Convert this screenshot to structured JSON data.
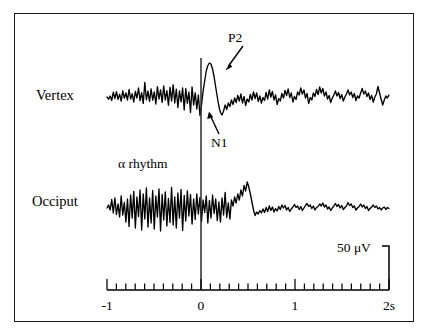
{
  "figure": {
    "type": "eeg-erp-waveform-figure",
    "background_color": "#ffffff",
    "border_color": "#1a1a1a",
    "trace_color": "#000000"
  },
  "labels": {
    "vertex": "Vertex",
    "occiput": "Occiput",
    "alpha_rhythm": "α rhythm",
    "p2": "P2",
    "n1": "N1",
    "scale_bar": "50 μV"
  },
  "axis": {
    "xlabel": "",
    "unit_suffix": "s",
    "tick_labels": [
      "-1",
      "0",
      "1",
      "2s"
    ],
    "tick_label_values": [
      -1,
      0,
      1,
      2
    ],
    "minor_tick_interval": 0.1,
    "xmin": -1,
    "xmax": 2,
    "stimulus_time": 0
  },
  "chart_data": {
    "type": "line",
    "title": "",
    "subtitle": "",
    "xlabel": "Time (s)",
    "ylabel": "Amplitude (μV)",
    "xlim": [
      -1,
      2
    ],
    "grid": false,
    "legend": "none",
    "annotations": [
      {
        "label": "P2",
        "channel": "Vertex",
        "time": 0.2,
        "kind": "positive-peak",
        "arrow": "down-left"
      },
      {
        "label": "N1",
        "channel": "Vertex",
        "time": 0.09,
        "kind": "negative-peak",
        "arrow": "up-left"
      },
      {
        "label": "α rhythm",
        "channel": "Occiput",
        "time": -0.55,
        "kind": "region-note",
        "arrow": "none"
      },
      {
        "label": "50 μV",
        "kind": "scale-bar",
        "value": 50,
        "unit": "μV"
      }
    ],
    "scale_bar": {
      "value": 50,
      "unit": "μV",
      "time_position": 2.0
    },
    "stimulus_marker": {
      "time": 0,
      "style": "vertical-line"
    },
    "series": [
      {
        "name": "Vertex",
        "baseline_y": 97,
        "amplitude_scale": 1.0,
        "values": [
          0.0,
          -2.2,
          1.0,
          -3.4,
          4.8,
          -1.6,
          5.4,
          -2.4,
          2.8,
          -4.2,
          6.2,
          -1.2,
          4.0,
          -3.0,
          7.5,
          -2.0,
          3.2,
          -5.0,
          5.6,
          -1.0,
          9.0,
          -3.6,
          4.4,
          -6.4,
          14.5,
          -2.8,
          6.0,
          -4.4,
          8.2,
          -3.2,
          5.0,
          -7.0,
          10.4,
          -2.0,
          7.2,
          -5.4,
          11.0,
          -3.0,
          6.4,
          -8.2,
          9.6,
          -4.0,
          12.2,
          -6.0,
          7.8,
          -10.5,
          6.2,
          -4.8,
          9.0,
          -13.0,
          8.4,
          -6.2,
          5.0,
          -15.5,
          10.0,
          -8.0,
          4.2,
          -12.0,
          2.0,
          -18.5,
          -8.0,
          6.0,
          16.0,
          26.0,
          31.5,
          34.0,
          33.0,
          28.0,
          20.0,
          10.0,
          0.0,
          -9.0,
          -15.5,
          -18.0,
          -14.0,
          -8.0,
          -12.5,
          -6.0,
          -9.5,
          -3.0,
          -7.5,
          -1.0,
          -5.5,
          1.5,
          -4.0,
          3.0,
          -6.0,
          0.5,
          -8.5,
          -2.0,
          -5.0,
          2.5,
          -3.0,
          5.0,
          -1.5,
          4.0,
          -4.5,
          1.0,
          -6.0,
          -0.5,
          -3.5,
          4.5,
          -2.0,
          7.0,
          0.0,
          5.5,
          -3.0,
          2.0,
          -7.5,
          -1.5,
          -4.0,
          3.5,
          -1.0,
          6.5,
          1.5,
          8.0,
          -0.5,
          4.0,
          -5.0,
          0.5,
          -2.5,
          5.0,
          2.0,
          9.0,
          3.0,
          7.0,
          -1.0,
          3.5,
          -6.5,
          -0.5,
          -3.0,
          4.0,
          0.5,
          7.5,
          2.5,
          10.0,
          4.0,
          8.5,
          1.0,
          5.0,
          -2.0,
          1.5,
          -5.5,
          -1.0,
          2.0,
          6.0,
          1.0,
          4.5,
          -1.5,
          2.5,
          -4.0,
          0.0,
          3.0,
          7.0,
          2.0,
          5.0,
          -0.5,
          3.5,
          -3.5,
          1.0,
          -1.0,
          4.0,
          8.5,
          3.0,
          6.0,
          0.5,
          4.0,
          -2.5,
          1.5,
          -5.0,
          0.0,
          3.0,
          10.5,
          4.0,
          -2.0,
          -8.0,
          -3.0,
          1.0,
          -1.0,
          2.0
        ]
      },
      {
        "name": "Occiput",
        "baseline_y": 208,
        "amplitude_scale": 1.0,
        "values": [
          0.0,
          3.0,
          -2.0,
          8.5,
          -5.0,
          10.0,
          -6.5,
          4.0,
          -9.0,
          12.0,
          -7.0,
          5.5,
          -14.0,
          9.0,
          -18.5,
          13.0,
          -10.0,
          16.5,
          -20.0,
          11.0,
          -8.5,
          18.0,
          -22.0,
          14.0,
          -11.0,
          20.0,
          -19.0,
          10.0,
          -15.0,
          17.5,
          -21.0,
          12.0,
          -9.0,
          19.0,
          -23.0,
          13.5,
          -12.0,
          16.0,
          -18.0,
          9.5,
          -14.5,
          20.5,
          -17.0,
          11.0,
          -20.0,
          15.0,
          -10.0,
          18.5,
          -22.5,
          12.5,
          -13.0,
          17.0,
          -8.0,
          13.5,
          -16.0,
          9.0,
          -11.5,
          14.0,
          -6.0,
          10.5,
          -13.5,
          8.0,
          -4.5,
          12.0,
          -15.0,
          7.5,
          -10.0,
          13.0,
          -5.5,
          9.0,
          -12.5,
          6.0,
          -14.0,
          10.0,
          -7.0,
          15.5,
          -9.5,
          5.0,
          -11.0,
          8.0,
          2.0,
          11.0,
          5.0,
          14.0,
          8.0,
          18.0,
          12.0,
          22.5,
          17.0,
          26.0,
          21.0,
          14.0,
          6.0,
          -2.0,
          -7.5,
          -4.0,
          -6.0,
          -2.5,
          -5.0,
          -1.0,
          -4.5,
          0.5,
          -3.5,
          2.0,
          -2.5,
          1.0,
          -4.0,
          -0.5,
          -3.0,
          1.5,
          -1.5,
          3.0,
          0.0,
          2.5,
          -2.0,
          0.5,
          -3.5,
          -1.0,
          1.0,
          3.5,
          0.5,
          2.0,
          -1.5,
          1.5,
          -2.5,
          0.0,
          2.5,
          4.5,
          1.5,
          3.0,
          -0.5,
          2.0,
          -2.0,
          0.5,
          1.5,
          4.0,
          2.0,
          5.0,
          1.0,
          3.0,
          -1.0,
          1.0,
          -2.5,
          0.0,
          2.0,
          4.5,
          1.5,
          3.5,
          0.0,
          2.5,
          -1.5,
          0.5,
          2.0,
          5.5,
          2.5,
          4.0,
          0.5,
          2.0,
          -2.0,
          0.0,
          1.5,
          4.0,
          1.0,
          3.0,
          -0.5,
          1.5,
          -2.5,
          -0.5,
          1.0,
          3.0,
          0.5,
          2.0,
          -1.0,
          0.5,
          -2.0,
          0.0,
          1.0,
          -1.5,
          0.5,
          -0.5
        ]
      }
    ]
  },
  "geometry": {
    "plot_left_x": 107,
    "plot_right_x": 389,
    "axis_y": 290,
    "trace_start_x": 107,
    "trace_end_x": 389
  }
}
